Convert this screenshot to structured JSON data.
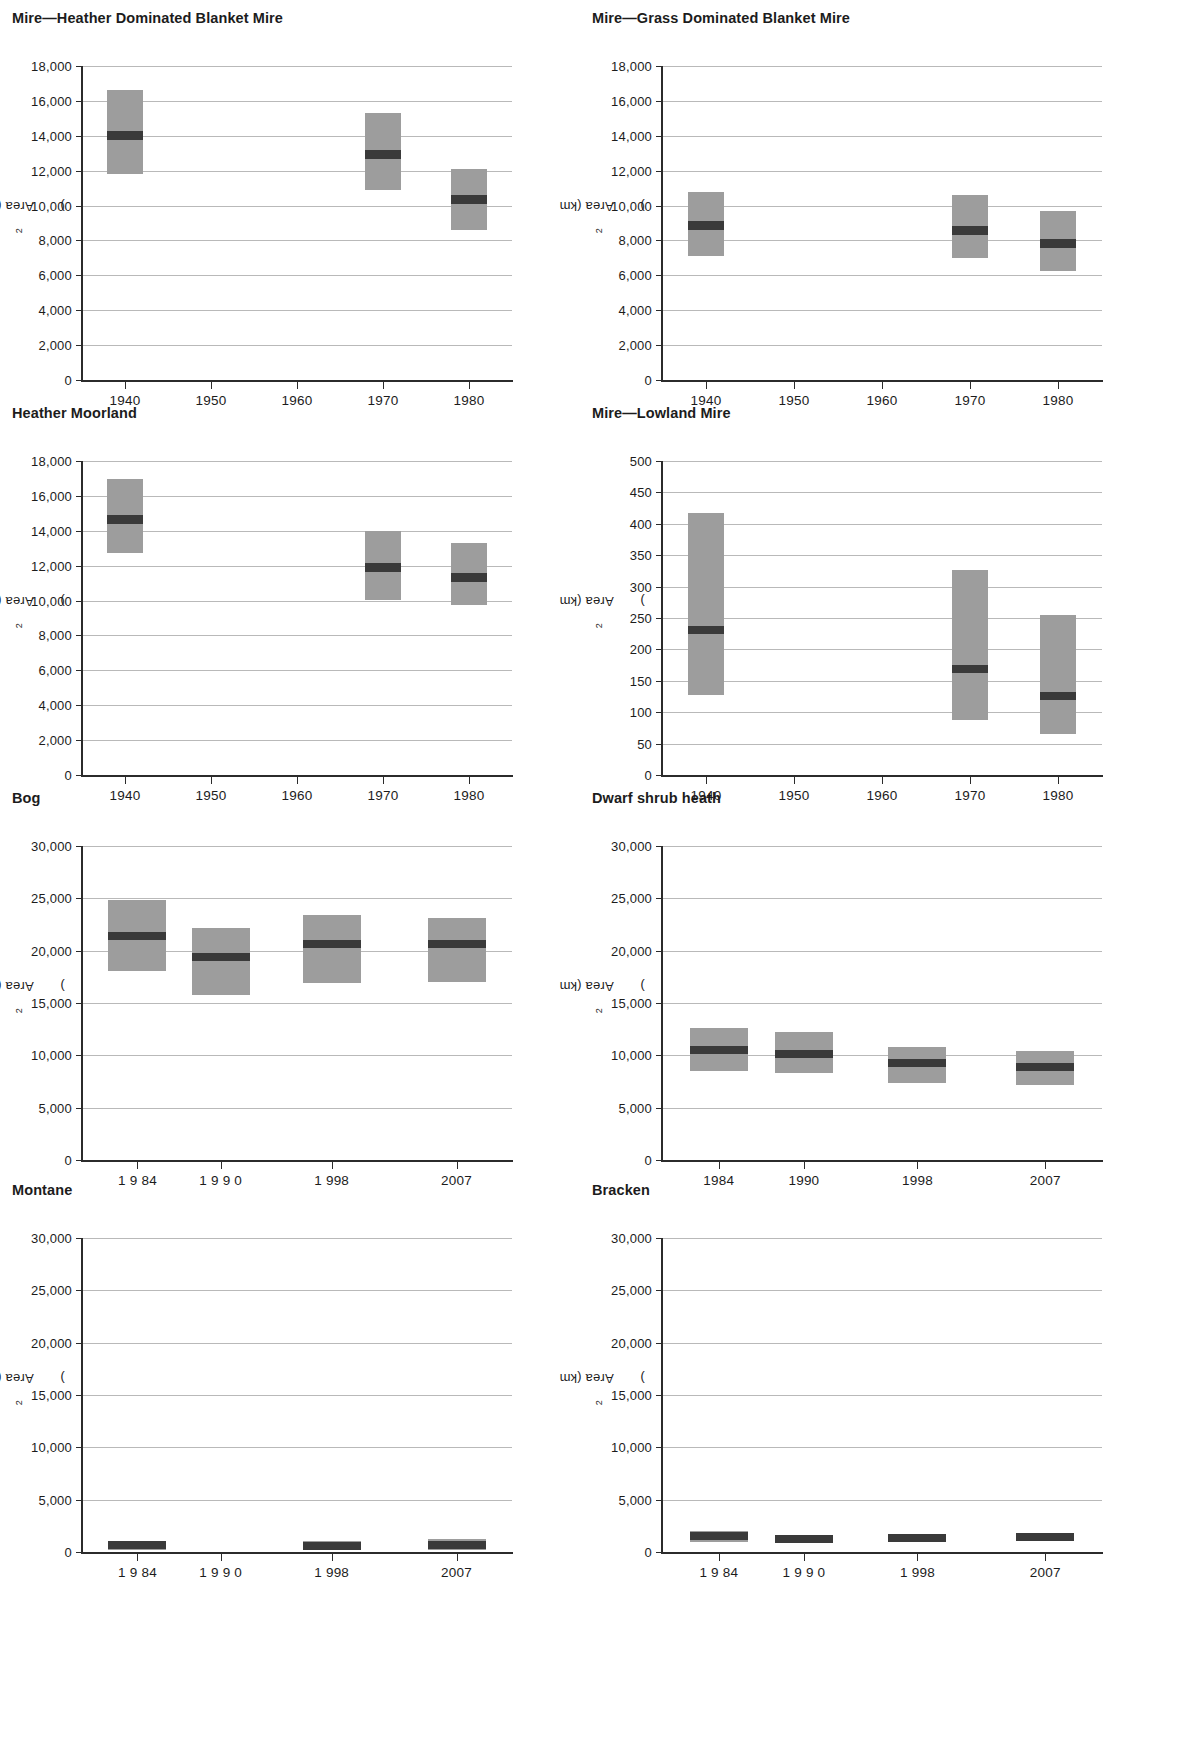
{
  "figure": {
    "axis_label": "Area (km",
    "axis_label_sup": "2",
    "axis_label_close": ")",
    "box_color": "#9d9d9d",
    "median_color": "#3a3a3a",
    "grid_color": "#b9b9b9",
    "axis_color": "#2b2b2b"
  },
  "chart_data": [
    {
      "type": "bar",
      "panel_index": 0,
      "title": "Mire—Heather Dominated Blanket Mire",
      "xlabel": "",
      "ylabel": "Area (km2)",
      "ylim": [
        0,
        18000
      ],
      "yticks": [
        0,
        2000,
        4000,
        6000,
        8000,
        10000,
        12000,
        14000,
        16000,
        18000
      ],
      "ytick_labels": [
        "0",
        "2,000",
        "4,000",
        "6,000",
        "8,000",
        "10,000",
        "12,000",
        "14,000",
        "16,000",
        "18,000"
      ],
      "xlim": [
        1935,
        1985
      ],
      "xticks": [
        1940,
        1950,
        1960,
        1970,
        1980
      ],
      "xtick_labels": [
        "1940",
        "1950",
        "1960",
        "1970",
        "1980"
      ],
      "grid": true,
      "legend": "none",
      "series": [
        {
          "name": "Area estimate with confidence interval",
          "points": [
            {
              "x": 1940,
              "low": 11800,
              "high": 16600,
              "median": 14000
            },
            {
              "x": 1970,
              "low": 10900,
              "high": 15300,
              "median": 12900
            },
            {
              "x": 1980,
              "low": 8600,
              "high": 12100,
              "median": 10350
            }
          ]
        }
      ]
    },
    {
      "type": "bar",
      "panel_index": 1,
      "title": "Mire—Grass Dominated Blanket Mire",
      "xlabel": "",
      "ylabel": "Area (km2)",
      "ylim": [
        0,
        18000
      ],
      "yticks": [
        0,
        2000,
        4000,
        6000,
        8000,
        10000,
        12000,
        14000,
        16000,
        18000
      ],
      "ytick_labels": [
        "0",
        "2,000",
        "4,000",
        "6,000",
        "8,000",
        "10,000",
        "12,000",
        "14,000",
        "16,000",
        "18,000"
      ],
      "xlim": [
        1935,
        1985
      ],
      "xticks": [
        1940,
        1950,
        1960,
        1970,
        1980
      ],
      "xtick_labels": [
        "1940",
        "1950",
        "1960",
        "1970",
        "1980"
      ],
      "grid": true,
      "legend": "none",
      "series": [
        {
          "name": "Area estimate with confidence interval",
          "points": [
            {
              "x": 1940,
              "low": 7100,
              "high": 10750,
              "median": 8850
            },
            {
              "x": 1970,
              "low": 7000,
              "high": 10600,
              "median": 8550
            },
            {
              "x": 1980,
              "low": 6250,
              "high": 9700,
              "median": 7850
            }
          ]
        }
      ]
    },
    {
      "type": "bar",
      "panel_index": 2,
      "title": "Heather Moorland",
      "xlabel": "",
      "ylabel": "Area (km2)",
      "ylim": [
        0,
        18000
      ],
      "yticks": [
        0,
        2000,
        4000,
        6000,
        8000,
        10000,
        12000,
        14000,
        16000,
        18000
      ],
      "ytick_labels": [
        "0",
        "2,000",
        "4,000",
        "6,000",
        "8,000",
        "10,000",
        "12,000",
        "14,000",
        "16,000",
        "18,000"
      ],
      "xlim": [
        1935,
        1985
      ],
      "xticks": [
        1940,
        1950,
        1960,
        1970,
        1980
      ],
      "xtick_labels": [
        "1940",
        "1950",
        "1960",
        "1970",
        "1980"
      ],
      "grid": true,
      "legend": "none",
      "series": [
        {
          "name": "Area estimate with confidence interval",
          "points": [
            {
              "x": 1940,
              "low": 12700,
              "high": 16950,
              "median": 14650
            },
            {
              "x": 1970,
              "low": 10050,
              "high": 14000,
              "median": 11900
            },
            {
              "x": 1980,
              "low": 9750,
              "high": 13300,
              "median": 11300
            }
          ]
        }
      ]
    },
    {
      "type": "bar",
      "panel_index": 3,
      "title": "Mire—Lowland Mire",
      "xlabel": "",
      "ylabel": "Area (km2)",
      "ylim": [
        0,
        500
      ],
      "yticks": [
        0,
        50,
        100,
        150,
        200,
        250,
        300,
        350,
        400,
        450,
        500
      ],
      "ytick_labels": [
        "0",
        "50",
        "100",
        "150",
        "200",
        "250",
        "300",
        "350",
        "400",
        "450",
        "500"
      ],
      "xlim": [
        1935,
        1985
      ],
      "xticks": [
        1940,
        1950,
        1960,
        1970,
        1980
      ],
      "xtick_labels": [
        "1940",
        "1950",
        "1960",
        "1970",
        "1980"
      ],
      "grid": true,
      "legend": "none",
      "series": [
        {
          "name": "Area estimate with confidence interval",
          "points": [
            {
              "x": 1940,
              "low": 128,
              "high": 417,
              "median": 231
            },
            {
              "x": 1970,
              "low": 88,
              "high": 327,
              "median": 168
            },
            {
              "x": 1980,
              "low": 66,
              "high": 254,
              "median": 126
            }
          ]
        }
      ]
    },
    {
      "type": "bar",
      "panel_index": 4,
      "title": "Bog",
      "xlabel": "",
      "ylabel": "Area (km2)",
      "ylim": [
        0,
        30000
      ],
      "yticks": [
        0,
        5000,
        10000,
        15000,
        20000,
        25000,
        30000
      ],
      "ytick_labels": [
        "0",
        "5,000",
        "10,000",
        "15,000",
        "20,000",
        "25,000",
        "30,000"
      ],
      "xlim": [
        1980,
        2011
      ],
      "xticks": [
        1984,
        1990,
        1998,
        2007
      ],
      "xtick_labels": [
        "1 9 84",
        "1 9 9 0",
        "1 998",
        "2007"
      ],
      "grid": true,
      "legend": "none",
      "series": [
        {
          "name": "Area estimate with confidence interval",
          "points": [
            {
              "x": 1984,
              "low": 18100,
              "high": 24850,
              "median": 21400
            },
            {
              "x": 1990,
              "low": 15750,
              "high": 22200,
              "median": 19400
            },
            {
              "x": 1998,
              "low": 16950,
              "high": 23400,
              "median": 20600
            },
            {
              "x": 2007,
              "low": 17000,
              "high": 23150,
              "median": 20600
            }
          ]
        }
      ]
    },
    {
      "type": "bar",
      "panel_index": 5,
      "title": "Dwarf shrub heath",
      "xlabel": "",
      "ylabel": "Area (km2)",
      "ylim": [
        0,
        30000
      ],
      "yticks": [
        0,
        5000,
        10000,
        15000,
        20000,
        25000,
        30000
      ],
      "ytick_labels": [
        "0",
        "5,000",
        "10,000",
        "15,000",
        "20,000",
        "25,000",
        "30,000"
      ],
      "xlim": [
        1980,
        2011
      ],
      "xticks": [
        1984,
        1990,
        1998,
        2007
      ],
      "xtick_labels": [
        "1984",
        "1990",
        "1998",
        "2007"
      ],
      "grid": true,
      "legend": "none",
      "series": [
        {
          "name": "Area estimate with confidence interval",
          "points": [
            {
              "x": 1984,
              "low": 8500,
              "high": 12600,
              "median": 10500
            },
            {
              "x": 1990,
              "low": 8350,
              "high": 12200,
              "median": 10150
            },
            {
              "x": 1998,
              "low": 7350,
              "high": 10800,
              "median": 9300
            },
            {
              "x": 2007,
              "low": 7150,
              "high": 10400,
              "median": 8850
            }
          ]
        }
      ]
    },
    {
      "type": "bar",
      "panel_index": 6,
      "title": "Montane",
      "xlabel": "",
      "ylabel": "Area (km2)",
      "ylim": [
        0,
        30000
      ],
      "yticks": [
        0,
        5000,
        10000,
        15000,
        20000,
        25000,
        30000
      ],
      "ytick_labels": [
        "0",
        "5,000",
        "10,000",
        "15,000",
        "20,000",
        "25,000",
        "30,000"
      ],
      "xlim": [
        1980,
        2011
      ],
      "xticks": [
        1984,
        1990,
        1998,
        2007
      ],
      "xtick_labels": [
        "1 9 84",
        "1 9 9 0",
        "1 998",
        "2007"
      ],
      "grid": true,
      "legend": "none",
      "series": [
        {
          "name": "Area estimate with confidence interval",
          "points": [
            {
              "x": 1984,
              "low": 180,
              "high": 1030,
              "median": 640
            },
            {
              "x": 1990,
              "low": 0,
              "high": 0,
              "median": 0
            },
            {
              "x": 1998,
              "low": 170,
              "high": 1030,
              "median": 620
            },
            {
              "x": 2007,
              "low": 180,
              "high": 1260,
              "median": 700
            }
          ]
        }
      ]
    },
    {
      "type": "bar",
      "panel_index": 7,
      "title": "Bracken",
      "xlabel": "",
      "ylabel": "Area (km2)",
      "ylim": [
        0,
        30000
      ],
      "yticks": [
        0,
        5000,
        10000,
        15000,
        20000,
        25000,
        30000
      ],
      "ytick_labels": [
        "0",
        "5,000",
        "10,000",
        "15,000",
        "20,000",
        "25,000",
        "30,000"
      ],
      "xlim": [
        1980,
        2011
      ],
      "xticks": [
        1984,
        1990,
        1998,
        2007
      ],
      "xtick_labels": [
        "1 9 84",
        "1 9 9 0",
        "1 998",
        "2007"
      ],
      "grid": true,
      "legend": "none",
      "series": [
        {
          "name": "Area estimate with confidence interval",
          "points": [
            {
              "x": 1984,
              "low": 1000,
              "high": 2000,
              "median": 1500
            },
            {
              "x": 1990,
              "low": 900,
              "high": 1650,
              "median": 1270
            },
            {
              "x": 1998,
              "low": 950,
              "high": 1760,
              "median": 1360
            },
            {
              "x": 2007,
              "low": 1050,
              "high": 1740,
              "median": 1400
            }
          ]
        }
      ]
    }
  ],
  "layout": {
    "panels": [
      {
        "left": 12,
        "top": 10,
        "width": 560,
        "plot_left": 70,
        "plot_top": 34,
        "plot_width": 430,
        "plot_height": 314
      },
      {
        "left": 592,
        "top": 10,
        "width": 600,
        "plot_left": 70,
        "plot_top": 34,
        "plot_width": 440,
        "plot_height": 314
      },
      {
        "left": 12,
        "top": 405,
        "width": 560,
        "plot_left": 70,
        "plot_top": 34,
        "plot_width": 430,
        "plot_height": 314
      },
      {
        "left": 592,
        "top": 405,
        "width": 600,
        "plot_left": 70,
        "plot_top": 34,
        "plot_width": 440,
        "plot_height": 314
      },
      {
        "left": 12,
        "top": 790,
        "width": 560,
        "plot_left": 70,
        "plot_top": 34,
        "plot_width": 430,
        "plot_height": 314
      },
      {
        "left": 592,
        "top": 790,
        "width": 600,
        "plot_left": 70,
        "plot_top": 34,
        "plot_width": 440,
        "plot_height": 314
      },
      {
        "left": 12,
        "top": 1182,
        "width": 560,
        "plot_left": 70,
        "plot_top": 34,
        "plot_width": 430,
        "plot_height": 314
      },
      {
        "left": 592,
        "top": 1182,
        "width": 600,
        "plot_left": 70,
        "plot_top": 34,
        "plot_width": 440,
        "plot_height": 314
      }
    ]
  }
}
